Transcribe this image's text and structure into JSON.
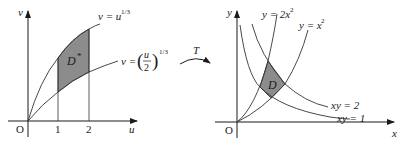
{
  "left_panel": {
    "axes": {
      "x_label": "u",
      "y_label": "v",
      "origin_label": "O"
    },
    "ticks": [
      "1",
      "2"
    ],
    "curves": [
      {
        "name": "upper",
        "label_lhs": "v = u",
        "label_exp": "1/3"
      },
      {
        "name": "lower",
        "label_lhs": "v =",
        "label_frac_num": "u",
        "label_frac_den": "2",
        "label_exp": "1/3"
      }
    ],
    "region": {
      "label": "D",
      "superscript": "*"
    },
    "colors": {
      "shade": "#8a8a8a",
      "line": "#333333"
    }
  },
  "transform": {
    "label": "T"
  },
  "right_panel": {
    "axes": {
      "x_label": "x",
      "y_label": "y",
      "origin_label": "O"
    },
    "curves": [
      {
        "name": "y-2x2",
        "label": "y = 2x",
        "exp": "2"
      },
      {
        "name": "y-x2",
        "label": "y = x",
        "exp": "2"
      },
      {
        "name": "xy-2",
        "label": "xy = 2"
      },
      {
        "name": "xy-1",
        "label": "xy = 1"
      }
    ],
    "region": {
      "label": "D"
    },
    "colors": {
      "shade": "#8a8a8a",
      "line": "#333333"
    }
  }
}
